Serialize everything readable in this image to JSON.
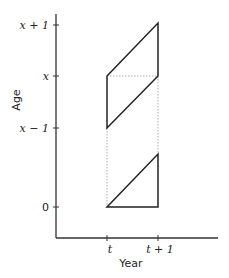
{
  "diagram": {
    "type": "lexis-diagram",
    "xlabel": "Year",
    "ylabel": "Age",
    "x_ticks": [
      "t",
      "t + 1"
    ],
    "y_ticks": [
      "x + 1",
      "x",
      "x − 1",
      "0"
    ],
    "shapes": [
      {
        "name": "upper-parallelogram",
        "description": "cohort parallelogram between ages x-1 and x+1 over year t to t+1"
      },
      {
        "name": "lower-triangle",
        "description": "birth triangle from age 0 over year t to t+1"
      }
    ],
    "colors": {
      "line": "#222222",
      "dotted": "#999999"
    }
  }
}
